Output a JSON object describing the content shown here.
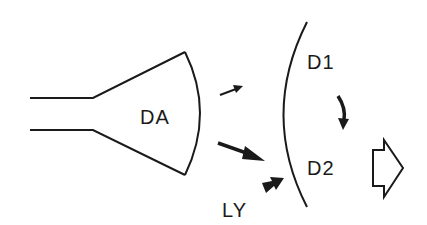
{
  "diagram": {
    "labels": {
      "source": "DA",
      "target_upper": "D1",
      "target_lower": "D2",
      "side_input": "LY"
    },
    "elements": [
      {
        "id": "funnel",
        "description": "horn / funnel shape with curved mouth labeled DA"
      },
      {
        "id": "small-arrow",
        "description": "thin arrow from DA up-right"
      },
      {
        "id": "large-arrow",
        "description": "thick arrow from DA down-right toward D2"
      },
      {
        "id": "ly-arrow",
        "description": "short thick arrow from LY toward the arc"
      },
      {
        "id": "barrier-arc",
        "description": "large curved boundary separating DA from D1/D2"
      },
      {
        "id": "d1-d2-arrow",
        "description": "curved arrow from D1 down to D2"
      },
      {
        "id": "output-arrow",
        "description": "hollow block arrow pointing right"
      }
    ],
    "colors": {
      "stroke": "#1a1a1a",
      "background": "#ffffff"
    }
  }
}
